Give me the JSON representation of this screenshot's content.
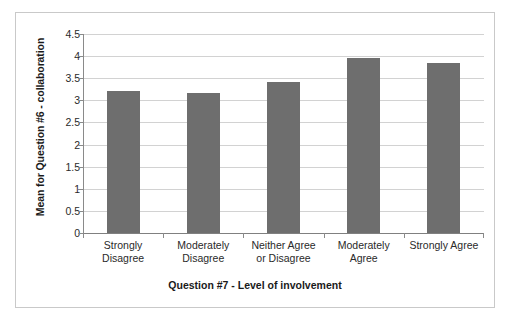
{
  "chart_data": {
    "type": "bar",
    "title": "",
    "xlabel": "Question #7 - Level of involvement",
    "ylabel": "Mean for Question #6 - collaboration",
    "categories": [
      "Strongly Disagree",
      "Moderately Disagree",
      "Neither Agree or Disagree",
      "Moderately Agree",
      "Strongly Agree"
    ],
    "category_lines": [
      [
        "Strongly",
        "Disagree"
      ],
      [
        "Moderately",
        "Disagree"
      ],
      [
        "Neither Agree",
        "or Disagree"
      ],
      [
        "Moderately",
        "Agree"
      ],
      [
        "Strongly Agree",
        ""
      ]
    ],
    "values": [
      3.21,
      3.17,
      3.42,
      3.95,
      3.84
    ],
    "ylim": [
      0,
      4.5
    ],
    "yticks": [
      0,
      0.5,
      1,
      1.5,
      2,
      2.5,
      3,
      3.5,
      4,
      4.5
    ],
    "ytick_labels": [
      "0",
      "0.5",
      "1",
      "1.5",
      "2",
      "2.5",
      "3",
      "3.5",
      "4",
      "4.5"
    ],
    "grid": true,
    "legend": false,
    "bar_color": "#6e6e6e",
    "grid_color": "#d2d2d2",
    "axis_color": "#8a8a8a",
    "frame_color": "#c9c9c9",
    "background": "#ffffff"
  }
}
